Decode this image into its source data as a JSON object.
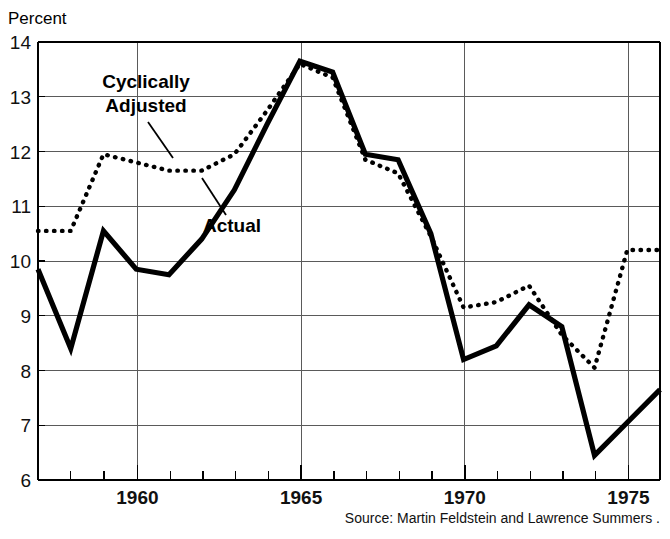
{
  "figure": {
    "y_axis_unit": "Percent",
    "source_note": "Source: Martin Feldstein and Lawrence Summers ."
  },
  "annotations": {
    "adjusted_line1": "Cyclically",
    "adjusted_line2": "Adjusted",
    "actual": "Actual"
  },
  "chart_data": {
    "type": "line",
    "title": "",
    "subtitle": "",
    "xlabel": "",
    "ylabel": "Percent",
    "xlim": [
      1957,
      1976
    ],
    "ylim": [
      6,
      14
    ],
    "yticks": [
      6,
      7,
      8,
      9,
      10,
      11,
      12,
      13,
      14
    ],
    "ytick_labels": [
      "6",
      "7",
      "8",
      "9",
      "10",
      "11",
      "12",
      "13",
      "14"
    ],
    "xticks": [
      1960,
      1965,
      1970,
      1975
    ],
    "xtick_labels": [
      "1960",
      "1965",
      "1970",
      "1975"
    ],
    "x_minor_ticks": [
      1958,
      1959,
      1961,
      1962,
      1963,
      1964,
      1966,
      1967,
      1968,
      1969,
      1971,
      1972,
      1973,
      1974,
      1976
    ],
    "grid": true,
    "legend_position": "inline-annotation",
    "x": [
      1957,
      1958,
      1959,
      1960,
      1961,
      1962,
      1963,
      1964,
      1965,
      1966,
      1967,
      1968,
      1969,
      1970,
      1971,
      1972,
      1973,
      1974,
      1975,
      1976
    ],
    "series": [
      {
        "name": "Cyclically Adjusted",
        "style": "dotted",
        "values": [
          10.55,
          10.55,
          11.95,
          11.8,
          11.65,
          11.65,
          11.95,
          12.75,
          13.6,
          13.35,
          11.85,
          11.6,
          10.45,
          9.15,
          9.25,
          9.55,
          8.65,
          8.05,
          10.2,
          10.2
        ]
      },
      {
        "name": "Actual",
        "style": "solid",
        "values": [
          9.85,
          8.4,
          10.55,
          9.85,
          9.75,
          10.4,
          11.3,
          12.5,
          13.65,
          13.45,
          11.95,
          11.85,
          10.5,
          8.2,
          8.45,
          9.2,
          8.8,
          6.45,
          7.05,
          7.65
        ]
      }
    ]
  }
}
